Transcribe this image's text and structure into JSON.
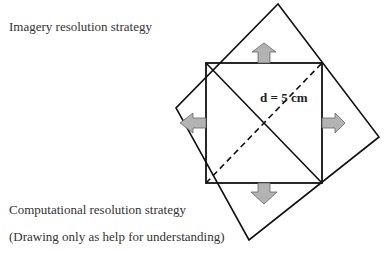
{
  "captions": {
    "imagery": "Imagery resolution strategy",
    "computational": "Computational resolution strategy",
    "note": "(Drawing only as help for understanding)"
  },
  "diagram": {
    "diagonal_label": "d = 5 cm",
    "colors": {
      "line": "#111111",
      "arrow_fill": "#b3b3b3",
      "arrow_stroke": "#666666"
    },
    "inner_square": {
      "x1": 206,
      "y1": 63,
      "x2": 322,
      "y2": 183
    },
    "outer_square_vertices": [
      [
        278,
        4
      ],
      [
        379,
        137
      ],
      [
        249,
        240
      ],
      [
        176,
        108
      ]
    ],
    "arrows": [
      "up",
      "right",
      "down",
      "left"
    ]
  }
}
